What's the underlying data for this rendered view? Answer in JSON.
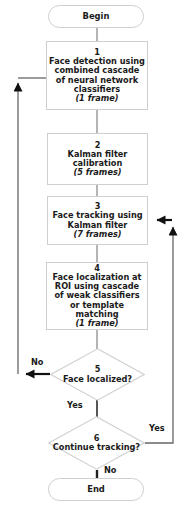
{
  "diagram": {
    "type": "flowchart",
    "colors": {
      "node_border": "#cfcfcf",
      "node_fill": "#ffffff",
      "connector": "#555555",
      "thick_connector": "#111111",
      "text": "#1a1a1a"
    },
    "nodes": [
      {
        "id": "begin",
        "shape": "terminator",
        "label": "Begin"
      },
      {
        "id": "step1",
        "shape": "process",
        "number": "1",
        "text": "Face detection using combined cascade of neural network classifiers",
        "frames": "(1 frame)"
      },
      {
        "id": "step2",
        "shape": "process",
        "number": "2",
        "text": "Kalman filter calibration",
        "frames": "(5 frames)"
      },
      {
        "id": "step3",
        "shape": "process",
        "number": "3",
        "text": "Face tracking using Kalman filter",
        "frames": "(7 frames)"
      },
      {
        "id": "step4",
        "shape": "process",
        "number": "4",
        "text": "Face localization at ROI using cascade of weak classifiers or template matching",
        "frames": "(1 frame)"
      },
      {
        "id": "step5",
        "shape": "decision",
        "number": "5",
        "text": "Face localized?"
      },
      {
        "id": "step6",
        "shape": "decision",
        "number": "6",
        "text": "Continue tracking?"
      },
      {
        "id": "end",
        "shape": "terminator",
        "label": "End"
      }
    ],
    "edge_labels": {
      "no_face_localized": "No",
      "yes_face_localized": "Yes",
      "yes_continue": "Yes",
      "no_continue": "No"
    },
    "edges": [
      {
        "from": "begin",
        "to": "step1",
        "label": ""
      },
      {
        "from": "step1",
        "to": "step2",
        "label": ""
      },
      {
        "from": "step2",
        "to": "step3",
        "label": ""
      },
      {
        "from": "step3",
        "to": "step4",
        "label": ""
      },
      {
        "from": "step4",
        "to": "step5",
        "label": ""
      },
      {
        "from": "step5",
        "to": "step1",
        "label": "No"
      },
      {
        "from": "step5",
        "to": "step6",
        "label": "Yes"
      },
      {
        "from": "step6",
        "to": "step3",
        "label": "Yes"
      },
      {
        "from": "step6",
        "to": "end",
        "label": "No"
      }
    ]
  }
}
